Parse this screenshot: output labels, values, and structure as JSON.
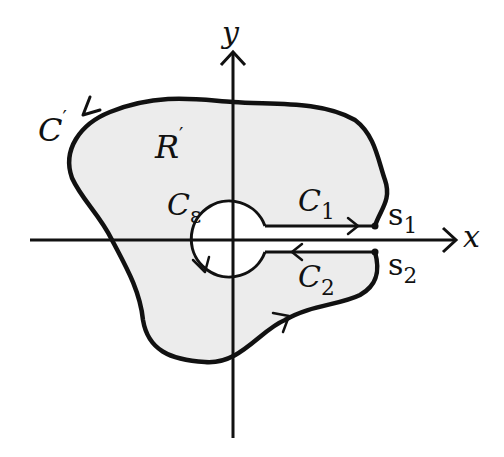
{
  "diagram": {
    "title": "",
    "colors": {
      "background": "#ffffff",
      "region_fill": "#eeeeee",
      "stroke": "#111111"
    },
    "axes": {
      "x_label": "x",
      "y_label": "y"
    },
    "labels": {
      "outer_contour": {
        "base": "C",
        "prime": "′"
      },
      "region": {
        "base": "R",
        "prime": "′"
      },
      "small_circle": {
        "base": "C",
        "sub": "ε"
      },
      "upper_segment": {
        "base": "C",
        "sub": "1"
      },
      "lower_segment": {
        "base": "C",
        "sub": "2"
      },
      "point_1": {
        "base": "s",
        "sub": "1"
      },
      "point_2": {
        "base": "s",
        "sub": "2"
      }
    },
    "elements": [
      "region R′ shaded, bounded by outer contour C′ (counterclockwise arrow)",
      "small circle C_ε around origin (clockwise arrow)",
      "segment C1 just above x-axis, arrow pointing right toward s1",
      "segment C2 just below x-axis, arrow pointing left away from s2",
      "points s1 and s2 marked with dots at the slit ends"
    ]
  }
}
